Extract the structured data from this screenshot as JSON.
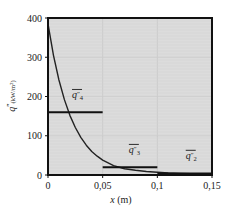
{
  "chart_data": {
    "type": "line",
    "title": "",
    "xlabel": "x (m)",
    "ylabel": "q″(kW/m²)",
    "xlim": [
      0,
      0.15
    ],
    "ylim": [
      0,
      400
    ],
    "xticks": [
      "0",
      "0,05",
      "0,1",
      "0,15"
    ],
    "xtick_values": [
      0,
      0.05,
      0.1,
      0.15
    ],
    "yticks": [
      "0",
      "100",
      "200",
      "300",
      "400"
    ],
    "ytick_values": [
      0,
      100,
      200,
      300,
      400
    ],
    "grid": true,
    "legend": "none",
    "series": [
      {
        "name": "q″(x)",
        "kind": "curve",
        "x": [
          0,
          0.005,
          0.01,
          0.015,
          0.02,
          0.025,
          0.03,
          0.035,
          0.04,
          0.045,
          0.05,
          0.06,
          0.07,
          0.08,
          0.09,
          0.1,
          0.11,
          0.12,
          0.13,
          0.14,
          0.15
        ],
        "y": [
          385,
          305,
          242,
          192,
          152,
          121,
          96,
          76,
          60,
          48,
          38,
          24,
          16,
          12,
          9,
          7,
          5,
          4,
          3,
          2,
          1
        ]
      },
      {
        "name": "q_bar_4",
        "kind": "segment",
        "x": [
          0,
          0.05
        ],
        "y": [
          160,
          160
        ],
        "label_main": "q",
        "label_prime": "″",
        "label_sub": "4"
      },
      {
        "name": "q_bar_3",
        "kind": "segment",
        "x": [
          0.05,
          0.1
        ],
        "y": [
          20,
          20
        ],
        "label_main": "q",
        "label_prime": "″",
        "label_sub": "3"
      },
      {
        "name": "q_bar_2",
        "kind": "segment",
        "x": [
          0.1,
          0.15
        ],
        "y": [
          4,
          4
        ],
        "label_main": "q",
        "label_prime": "″",
        "label_sub": "2"
      }
    ],
    "annotations": [
      {
        "name": "q-bar-4-label",
        "text": "q″₄",
        "x": 0.027,
        "y": 195
      },
      {
        "name": "q-bar-3-label",
        "text": "q″₃",
        "x": 0.079,
        "y": 55
      },
      {
        "name": "q-bar-2-label",
        "text": "q″₂",
        "x": 0.131,
        "y": 40
      }
    ],
    "colors": {
      "plot_background": "#dcdcdc",
      "page_background": "#ffffff",
      "curve": "#222222",
      "segment": "#111111",
      "grid": "#c9c9c9",
      "frame": "#111111",
      "text": "#1a1a1a"
    }
  },
  "axis": {
    "y_label_q": "q",
    "y_label_prime": "″",
    "y_label_unit_open": "(kW/m",
    "y_label_unit_sup": "2",
    "y_label_unit_close": ")",
    "x_label_var": "x",
    "x_label_unit": "(m)"
  }
}
